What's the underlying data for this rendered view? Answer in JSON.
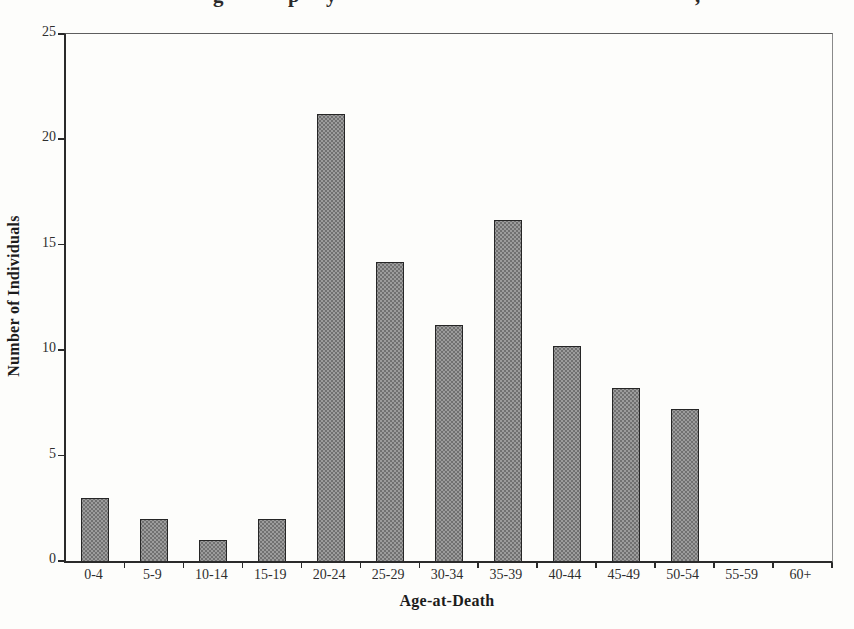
{
  "page": {
    "background": "#fdfdfb",
    "ink": "#1f1f1f"
  },
  "title_fragments": [
    {
      "glyph": "g",
      "x": 213
    },
    {
      "glyph": "p",
      "x": 288
    },
    {
      "glyph": "y",
      "x": 326
    },
    {
      "glyph": ",",
      "x": 695
    }
  ],
  "chart_data": {
    "type": "bar",
    "title": "",
    "xlabel": "Age-at-Death",
    "ylabel": "Number of Individuals",
    "categories": [
      "0-4",
      "5-9",
      "10-14",
      "15-19",
      "20-24",
      "25-29",
      "30-34",
      "35-39",
      "40-44",
      "45-49",
      "50-54",
      "55-59",
      "60+"
    ],
    "values": [
      3,
      2,
      1,
      2,
      21.2,
      14.2,
      11.2,
      16.2,
      10.2,
      8.2,
      7.2,
      0,
      0
    ],
    "ylim": [
      0,
      25
    ],
    "yticks": [
      0,
      5,
      10,
      15,
      20,
      25
    ],
    "grid": false,
    "legend": false,
    "bar_fill": "#9c9c9c",
    "bar_speckle": "#454545",
    "bar_border": "#262626"
  }
}
